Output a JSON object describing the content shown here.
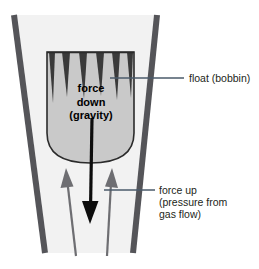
{
  "diagram": {
    "background_color": "#ffffff",
    "tube": {
      "name": "tapered-flow-tube",
      "wall_color": "#555559",
      "interior_color": "#f2f2f2",
      "left_wall": {
        "x1": 14,
        "y1": 15,
        "x2": 45,
        "y2": 253
      },
      "right_wall": {
        "x1": 157,
        "y1": 15,
        "x2": 133,
        "y2": 253
      },
      "wall_width": 6
    },
    "float": {
      "name": "float-bobbin",
      "fill_color": "#c9c9c9",
      "edge_color": "#2b2b2b",
      "notch_color": "#3a3a3a",
      "notch_count": 6,
      "bounds": {
        "x": 47,
        "y": 52,
        "width": 87,
        "height": 111
      }
    },
    "force_down_arrow": {
      "name": "force-down-arrow",
      "color": "#0d0d0d",
      "from": {
        "x": 92,
        "y": 118
      },
      "to": {
        "x": 90,
        "y": 224
      },
      "direction": "down"
    },
    "force_up_arrows": [
      {
        "name": "force-up-arrow-left",
        "color": "#6e6e72",
        "from": {
          "x": 76,
          "y": 256
        },
        "to": {
          "x": 66,
          "y": 170
        },
        "direction": "up"
      },
      {
        "name": "force-up-arrow-right",
        "color": "#6e6e72",
        "from": {
          "x": 107,
          "y": 256
        },
        "to": {
          "x": 112,
          "y": 170
        },
        "direction": "up"
      }
    ],
    "leader_lines": [
      {
        "name": "leader-line-float",
        "color": "#4a5a6a",
        "x1": 110,
        "y1": 78,
        "x2": 184,
        "y2": 78
      },
      {
        "name": "leader-line-force-up",
        "color": "#4a5a6a",
        "x1": 104,
        "y1": 190,
        "x2": 155,
        "y2": 190
      }
    ]
  },
  "labels": {
    "float": "float (bobbin)",
    "force_up": {
      "line1": "force up",
      "line2": "(pressure from",
      "line3": "gas flow)"
    },
    "force_down": {
      "line1": "force",
      "line2": "down",
      "line3": "(gravity)"
    }
  }
}
